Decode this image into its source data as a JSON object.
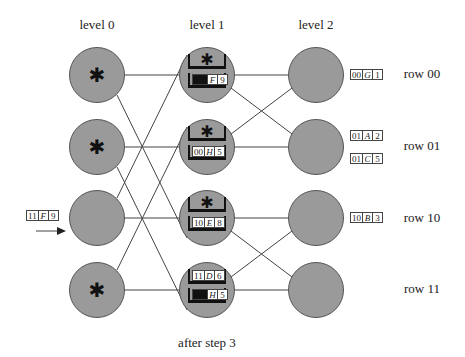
{
  "levels": [
    "level 0",
    "level 1",
    "level 2"
  ],
  "rows": [
    "row 00",
    "row 01",
    "row 10",
    "row 11"
  ],
  "caption": "after step 3",
  "incoming_packet": {
    "addr": "11",
    "name": "F",
    "val": "9"
  },
  "level0": [
    {
      "row": "00",
      "has_star": true
    },
    {
      "row": "01",
      "has_star": true
    },
    {
      "row": "10",
      "has_star": false
    },
    {
      "row": "11",
      "has_star": true
    }
  ],
  "level1": [
    {
      "row": "00",
      "top": {
        "star": true
      },
      "bottom": {
        "blank_addr": true,
        "name": "F",
        "val": "9"
      }
    },
    {
      "row": "01",
      "top": {
        "star": true
      },
      "bottom": {
        "addr": "00",
        "name": "H",
        "val": "5"
      }
    },
    {
      "row": "10",
      "top": {
        "star": true
      },
      "bottom": {
        "addr": "10",
        "name": "E",
        "val": "8"
      }
    },
    {
      "row": "11",
      "top": {
        "addr": "11",
        "name": "D",
        "val": "6"
      },
      "bottom": {
        "blank_addr": true,
        "name": "H",
        "val": "5"
      }
    }
  ],
  "output_packets": [
    {
      "row": "00",
      "packets": [
        {
          "addr": "00",
          "name": "G",
          "val": "1"
        }
      ]
    },
    {
      "row": "01",
      "packets": [
        {
          "addr": "01",
          "name": "A",
          "val": "2"
        },
        {
          "addr": "01",
          "name": "C",
          "val": "5"
        }
      ]
    },
    {
      "row": "10",
      "packets": [
        {
          "addr": "10",
          "name": "B",
          "val": "3"
        }
      ]
    },
    {
      "row": "11",
      "packets": []
    }
  ],
  "colors": {
    "node_fill": "#9a9a9a",
    "node_stroke": "#555555",
    "edge": "#444444",
    "buffer": "#111111"
  }
}
